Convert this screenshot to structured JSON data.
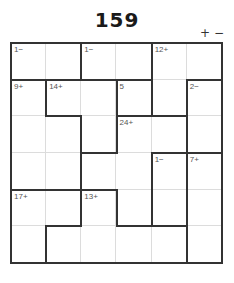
{
  "puzzle": {
    "title": "159",
    "zoom_in_label": "+",
    "zoom_out_label": "−",
    "size": 6,
    "line_color": "#333333",
    "cages": [
      {
        "clue": "1−",
        "cells": [
          [
            0,
            0
          ],
          [
            0,
            1
          ]
        ]
      },
      {
        "clue": "1−",
        "cells": [
          [
            0,
            2
          ],
          [
            0,
            3
          ]
        ]
      },
      {
        "clue": "12+",
        "cells": [
          [
            0,
            4
          ],
          [
            0,
            5
          ],
          [
            1,
            4
          ]
        ]
      },
      {
        "clue": "9+",
        "cells": [
          [
            1,
            0
          ],
          [
            2,
            0
          ],
          [
            2,
            1
          ],
          [
            3,
            0
          ],
          [
            3,
            1
          ]
        ]
      },
      {
        "clue": "14+",
        "cells": [
          [
            1,
            1
          ],
          [
            1,
            2
          ],
          [
            2,
            2
          ]
        ]
      },
      {
        "clue": "5",
        "cells": [
          [
            1,
            3
          ]
        ]
      },
      {
        "clue": "2−",
        "cells": [
          [
            1,
            5
          ],
          [
            2,
            5
          ]
        ]
      },
      {
        "clue": "24+",
        "cells": [
          [
            2,
            3
          ],
          [
            2,
            4
          ],
          [
            3,
            2
          ],
          [
            3,
            3
          ],
          [
            4,
            3
          ]
        ]
      },
      {
        "clue": "1−",
        "cells": [
          [
            3,
            4
          ],
          [
            4,
            4
          ]
        ]
      },
      {
        "clue": "7+",
        "cells": [
          [
            3,
            5
          ],
          [
            4,
            5
          ],
          [
            5,
            5
          ]
        ]
      },
      {
        "clue": "17+",
        "cells": [
          [
            4,
            0
          ],
          [
            4,
            1
          ],
          [
            5,
            0
          ]
        ]
      },
      {
        "clue": "13+",
        "cells": [
          [
            4,
            2
          ],
          [
            5,
            1
          ],
          [
            5,
            2
          ],
          [
            5,
            3
          ],
          [
            5,
            4
          ]
        ]
      }
    ]
  }
}
